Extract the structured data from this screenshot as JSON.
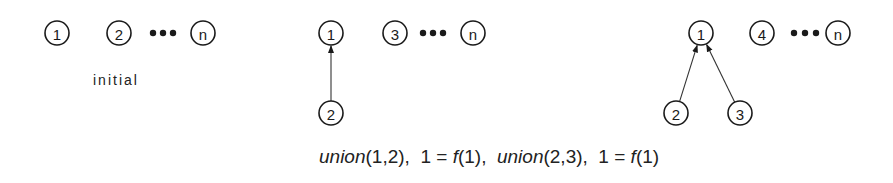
{
  "panels": [
    {
      "name": "initial",
      "label": "initial",
      "nodes": [
        {
          "id": "1",
          "text": "1",
          "x": 57,
          "y": 33
        },
        {
          "id": "2",
          "text": "2",
          "x": 119,
          "y": 33
        },
        {
          "id": "n",
          "text": "n",
          "x": 203,
          "y": 33
        }
      ],
      "ellipsis": {
        "x": [
          153,
          163,
          173
        ],
        "y": 33
      },
      "edges": []
    },
    {
      "name": "after-union-1-2",
      "nodes": [
        {
          "id": "1",
          "text": "1",
          "x": 331,
          "y": 33
        },
        {
          "id": "3",
          "text": "3",
          "x": 395,
          "y": 33
        },
        {
          "id": "n",
          "text": "n",
          "x": 473,
          "y": 33
        },
        {
          "id": "2",
          "text": "2",
          "x": 331,
          "y": 113
        }
      ],
      "ellipsis": {
        "x": [
          423,
          433,
          443
        ],
        "y": 33
      },
      "edges": [
        {
          "from": "2",
          "to": "1"
        }
      ]
    },
    {
      "name": "after-union-2-3",
      "nodes": [
        {
          "id": "1",
          "text": "1",
          "x": 701,
          "y": 33
        },
        {
          "id": "4",
          "text": "4",
          "x": 762,
          "y": 33
        },
        {
          "id": "n",
          "text": "n",
          "x": 838,
          "y": 33
        },
        {
          "id": "2",
          "text": "2",
          "x": 676,
          "y": 113
        },
        {
          "id": "3",
          "text": "3",
          "x": 740,
          "y": 113
        }
      ],
      "ellipsis": {
        "x": [
          794,
          805,
          816
        ],
        "y": 33
      },
      "edges": [
        {
          "from": "2",
          "to": "1"
        },
        {
          "from": "3",
          "to": "1"
        }
      ]
    }
  ],
  "caption": {
    "parts": [
      {
        "text": "union",
        "italic": true
      },
      {
        "text": "(1,2),  1 = ",
        "italic": false
      },
      {
        "text": "f",
        "italic": true
      },
      {
        "text": "(1),  ",
        "italic": false
      },
      {
        "text": "union",
        "italic": true
      },
      {
        "text": "(2,3),  1 = ",
        "italic": false
      },
      {
        "text": "f",
        "italic": true
      },
      {
        "text": "(1)",
        "italic": false
      }
    ]
  },
  "colors": {
    "stroke": "#1a1a1a",
    "background": "#ffffff"
  }
}
